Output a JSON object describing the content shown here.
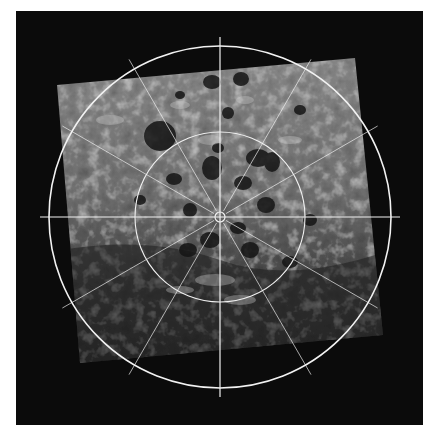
{
  "figure": {
    "colors": {
      "background": "#0b0b0b",
      "page": "#ffffff",
      "grid": "#f2f2f2",
      "terrain_light": "#b8b8b8",
      "terrain_mid": "#6e6e6e",
      "terrain_dark": "#1c1c1c"
    },
    "grid": {
      "center": [
        220,
        217
      ],
      "outer_circle_radius": 171,
      "inner_circle_radius": 85,
      "pole_marker_radius": 5,
      "spoke_angles_deg": [
        30,
        60,
        120,
        150,
        210,
        240,
        300,
        330
      ],
      "spoke_length": 182,
      "axis_half_length": 180
    },
    "mosaic_corners": [
      [
        57,
        85
      ],
      [
        355,
        58
      ],
      [
        383,
        335
      ],
      [
        80,
        363
      ]
    ]
  }
}
